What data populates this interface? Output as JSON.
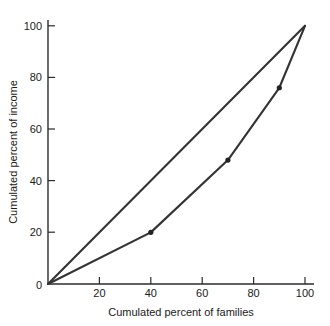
{
  "chart_data": {
    "type": "line",
    "title": "",
    "xlabel": "Cumulated percent of families",
    "ylabel": "Cumulated percent of income",
    "xlim": [
      0,
      100
    ],
    "ylim": [
      0,
      100
    ],
    "grid": false,
    "legend": "none",
    "x_ticks": [
      0,
      20,
      40,
      60,
      80,
      100
    ],
    "y_ticks": [
      0,
      20,
      40,
      60,
      80,
      100
    ],
    "x_tick_labels": [
      "0",
      "20",
      "40",
      "60",
      "80",
      "100"
    ],
    "y_tick_labels": [
      "0",
      "20",
      "40",
      "60",
      "80",
      "100"
    ],
    "origin_label": "0",
    "series": [
      {
        "name": "line-of-equality",
        "x": [
          0,
          100
        ],
        "y": [
          0,
          100
        ],
        "markers": false
      },
      {
        "name": "lorenz-curve",
        "x": [
          0,
          40,
          70,
          90,
          100
        ],
        "y": [
          0,
          20,
          48,
          76,
          100
        ],
        "markers": true,
        "marker_points": [
          {
            "x": 40,
            "y": 20
          },
          {
            "x": 70,
            "y": 48
          },
          {
            "x": 90,
            "y": 76
          }
        ]
      }
    ]
  },
  "colors": {
    "line": "#333333",
    "axis": "#2b2b2b",
    "marker": "#222222",
    "background": "#ffffff",
    "text": "#1a1a1a"
  },
  "labels": {
    "x_axis_title": "Cumulated percent of families",
    "y_axis_title": "Cumulated percent of income"
  }
}
